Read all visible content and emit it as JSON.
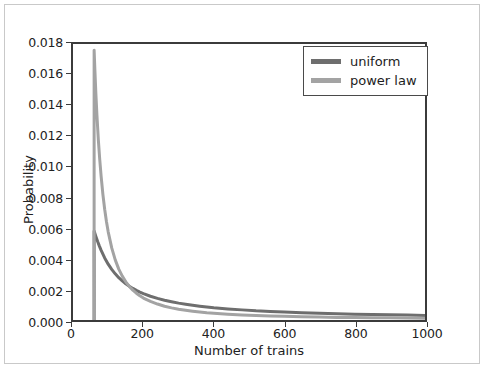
{
  "chart_data": {
    "type": "line",
    "title": "",
    "xlabel": "Number of trains",
    "ylabel": "Probability",
    "xlim": [
      0,
      1000
    ],
    "ylim": [
      0.0,
      0.018
    ],
    "xticks": [
      0,
      200,
      400,
      600,
      800,
      1000
    ],
    "xtick_labels": [
      "0",
      "200",
      "400",
      "600",
      "800",
      "1000"
    ],
    "yticks": [
      0.0,
      0.002,
      0.004,
      0.006,
      0.008,
      0.01,
      0.012,
      0.014,
      0.016,
      0.018
    ],
    "ytick_labels": [
      "0.000",
      "0.002",
      "0.004",
      "0.006",
      "0.008",
      "0.010",
      "0.012",
      "0.014",
      "0.016",
      "0.018"
    ],
    "grid": false,
    "legend_position": "upper right",
    "legend_entries": [
      "uniform",
      "power law"
    ],
    "series": [
      {
        "name": "uniform",
        "color": "#6e6e6e",
        "linewidth": 3,
        "x": [
          60,
          60,
          65,
          70,
          75,
          80,
          90,
          100,
          110,
          120,
          130,
          140,
          150,
          160,
          170,
          180,
          190,
          200,
          220,
          240,
          260,
          280,
          300,
          320,
          340,
          360,
          380,
          400,
          440,
          480,
          520,
          560,
          600,
          650,
          700,
          750,
          800,
          850,
          900,
          950,
          1000
        ],
        "y": [
          0.0,
          0.0058,
          0.00545,
          0.00512,
          0.00482,
          0.00454,
          0.00405,
          0.00364,
          0.0033,
          0.00301,
          0.00276,
          0.00255,
          0.00236,
          0.0022,
          0.00206,
          0.00193,
          0.00182,
          0.00172,
          0.00155,
          0.00141,
          0.00129,
          0.00119,
          0.0011,
          0.00103,
          0.00096,
          0.0009,
          0.00085,
          0.0008,
          0.00072,
          0.00066,
          0.0006,
          0.00056,
          0.00052,
          0.00048,
          0.00044,
          0.00041,
          0.00038,
          0.00036,
          0.00034,
          0.00032,
          0.0003
        ]
      },
      {
        "name": "power law",
        "color": "#a3a3a3",
        "linewidth": 3,
        "x": [
          60,
          60,
          62,
          65,
          68,
          72,
          76,
          80,
          85,
          90,
          95,
          100,
          110,
          120,
          130,
          140,
          150,
          160,
          170,
          180,
          190,
          200,
          220,
          240,
          260,
          280,
          300,
          320,
          340,
          360,
          380,
          400,
          440,
          480,
          520,
          560,
          600,
          650,
          700,
          750,
          800,
          850,
          900,
          950,
          1000
        ],
        "y": [
          0.0,
          0.0176,
          0.0164,
          0.01475,
          0.01335,
          0.01175,
          0.01045,
          0.00935,
          0.00818,
          0.00722,
          0.00642,
          0.00575,
          0.0047,
          0.00392,
          0.00332,
          0.00286,
          0.00249,
          0.00219,
          0.00195,
          0.00175,
          0.00158,
          0.00143,
          0.00121,
          0.00104,
          0.0009,
          0.00079,
          0.0007,
          0.00063,
          0.00057,
          0.00052,
          0.00047,
          0.00044,
          0.00037,
          0.00032,
          0.00029,
          0.00026,
          0.00024,
          0.00021,
          0.00019,
          0.00017,
          0.00016,
          0.00015,
          0.00014,
          0.00013,
          0.00012
        ]
      }
    ]
  },
  "legend": {
    "items": [
      {
        "label": "uniform",
        "color": "#6e6e6e"
      },
      {
        "label": "power law",
        "color": "#a3a3a3"
      }
    ]
  },
  "axes": {
    "xlabel": "Number of trains",
    "ylabel": "Probability",
    "frame_color": "#3b3b3b"
  }
}
